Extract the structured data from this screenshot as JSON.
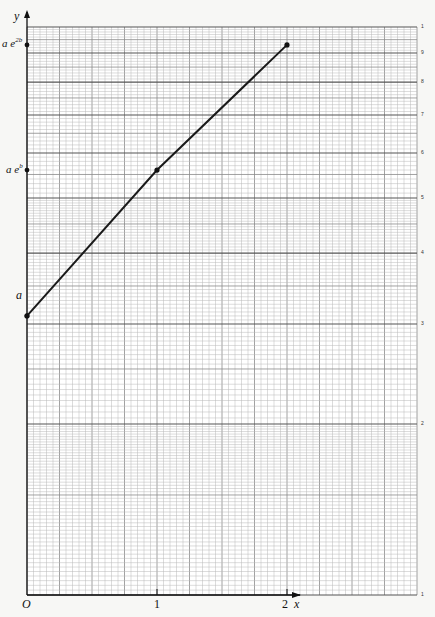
{
  "chart_data": {
    "type": "line",
    "title": "",
    "xlabel": "x",
    "ylabel": "y",
    "y_scale": "log",
    "xlim": [
      0,
      3.0
    ],
    "ylim": [
      1,
      10
    ],
    "x_ticks": [
      "O",
      "1",
      "2"
    ],
    "y_axis_labels_left": [
      "a",
      "a e^b",
      "a e^2b"
    ],
    "right_tick_labels": [
      "1",
      "2",
      "3",
      "4",
      "5",
      "6",
      "7",
      "8",
      "9",
      "1"
    ],
    "grid": true,
    "series": [
      {
        "name": "y = a e^(bx)",
        "x": [
          0,
          1,
          2
        ],
        "y_labels": [
          "a",
          "ae^b",
          "ae^2b"
        ],
        "y": [
          3.1,
          5.6,
          9.3
        ]
      }
    ],
    "points_marked": [
      {
        "x": 0,
        "label": "a"
      },
      {
        "x": 1,
        "label": "ae^b"
      },
      {
        "x": 2,
        "label": "ae^2b"
      }
    ]
  },
  "labels": {
    "y_axis": "y",
    "x_axis": "x",
    "origin": "O",
    "x1": "1",
    "x2": "2",
    "a": "a",
    "aeb_base": "a e",
    "aeb_sup": "b",
    "ae2b_base": "a e",
    "ae2b_sup": "2b"
  },
  "colors": {
    "grid_minor": "#b8b8b8",
    "grid_major": "#555555",
    "line": "#1a1a1a",
    "background": "#f7f7f5"
  }
}
